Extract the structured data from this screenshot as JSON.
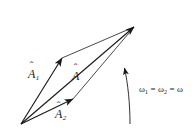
{
  "figure": {
    "kind": "vector-parallelogram-diagram",
    "background_color": "#ffffff",
    "stroke_color": "#1a1a1a",
    "labels": {
      "vector_1": {
        "symbol": "A",
        "accent": "hat",
        "subscript": "1"
      },
      "vector_2": {
        "symbol": "A",
        "accent": "hat",
        "subscript": "2"
      },
      "resultant": {
        "symbol": "A",
        "accent": "hat",
        "subscript": ""
      },
      "omega_text_part1": "ω",
      "omega_sub1": "1",
      "omega_eq1": " = ",
      "omega_text_part2": "ω",
      "omega_sub2": "2",
      "omega_eq2": " = ",
      "omega_text_part3": "ω"
    },
    "geometry": {
      "origin": [
        21,
        124
      ],
      "tip_vector_1": [
        62,
        58
      ],
      "tip_vector_2": [
        73,
        99
      ],
      "apex_resultant": [
        134,
        27
      ],
      "rotation_arrow_tail": [
        130,
        124
      ],
      "rotation_arrow_head": [
        124,
        66
      ]
    }
  }
}
